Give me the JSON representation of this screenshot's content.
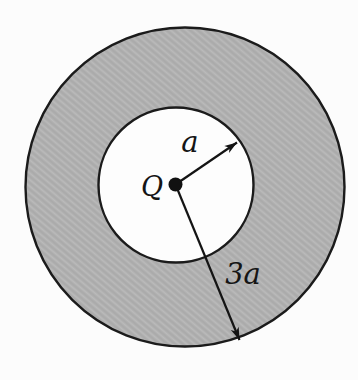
{
  "figure": {
    "type": "physics-diagram",
    "labels": {
      "charge": "Q",
      "inner_radius": "a",
      "outer_radius": "3a"
    },
    "colors": {
      "background": "#fcfcfc",
      "shell_fill": "#b2b2b2",
      "shell_hatch_dark": "#a6a6a6",
      "shell_hatch_light": "#bdbdbd",
      "cavity_fill": "#fdfdfd",
      "outline": "#1b1b1b",
      "charge_dot": "#111111",
      "label_ink": "#151515"
    }
  }
}
